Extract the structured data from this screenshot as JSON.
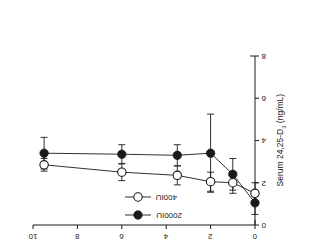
{
  "figure": {
    "rotation_degrees": 180,
    "background_color": "#ffffff",
    "ink_color": "#1a1a1a"
  },
  "axes": {
    "x_title": "Time (months)",
    "x_ticks": [
      "0",
      "2",
      "4",
      "6",
      "8",
      "10"
    ],
    "y_title_main": "Serum 24,25-D",
    "y_title_sub": "3",
    "y_title_unit": " (ng/mL)",
    "y_ticks": [
      "0",
      "2",
      "4",
      "6",
      "8"
    ]
  },
  "legend": {
    "entries": [
      {
        "label": "400IU",
        "marker": "open-circle",
        "color": "#1a1a1a"
      },
      {
        "label": "2000IU",
        "marker": "filled-circle",
        "color": "#1a1a1a"
      }
    ]
  },
  "chart_data": {
    "type": "line",
    "title": "",
    "xlabel": "Time (months)",
    "ylabel": "Serum 24,25-D3 (ng/mL)",
    "xlim": [
      0,
      10
    ],
    "ylim": [
      0,
      8
    ],
    "y_axis_inverted": false,
    "grid": false,
    "legend_position": "lower-center",
    "errorbars": "symmetric vertical",
    "x": [
      0,
      1,
      2,
      3.5,
      6,
      9.5
    ],
    "series": [
      {
        "name": "2000IU",
        "marker": "filled-circle",
        "values": [
          1.05,
          2.4,
          3.4,
          3.3,
          3.35,
          3.4
        ],
        "errors": [
          0.55,
          0.75,
          1.85,
          0.5,
          0.45,
          0.75
        ]
      },
      {
        "name": "400IU",
        "marker": "open-circle",
        "values": [
          1.5,
          2.0,
          2.05,
          2.35,
          2.5,
          2.85
        ],
        "errors": [
          0.5,
          0.5,
          0.45,
          0.45,
          0.4,
          0.3
        ]
      }
    ]
  }
}
